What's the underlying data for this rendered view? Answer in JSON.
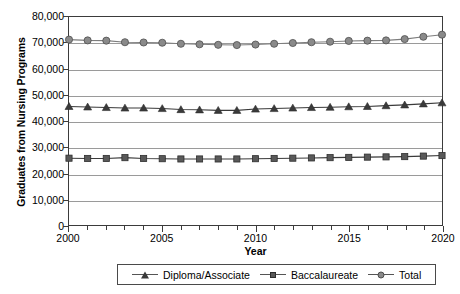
{
  "chart_data": {
    "type": "line",
    "title": "",
    "xlabel": "Year",
    "ylabel": "Graduates from Nursing Programs",
    "xlim": [
      2000,
      2020
    ],
    "ylim": [
      0,
      80000
    ],
    "grid": true,
    "legend_position": "bottom",
    "x": [
      2000,
      2001,
      2002,
      2003,
      2004,
      2005,
      2006,
      2007,
      2008,
      2009,
      2010,
      2011,
      2012,
      2013,
      2014,
      2015,
      2016,
      2017,
      2018,
      2019,
      2020
    ],
    "y_ticks": [
      0,
      10000,
      20000,
      30000,
      40000,
      50000,
      60000,
      70000,
      80000
    ],
    "y_tick_labels": [
      "0",
      "10,000",
      "20,000",
      "30,000",
      "40,000",
      "50,000",
      "60,000",
      "70,000",
      "80,000"
    ],
    "x_tick_labels": [
      {
        "value": 2000,
        "label": "2000"
      },
      {
        "value": 2005,
        "label": "2005"
      },
      {
        "value": 2010,
        "label": "2010"
      },
      {
        "value": 2015,
        "label": "2015"
      },
      {
        "value": 2020,
        "label": "2020"
      }
    ],
    "series": [
      {
        "name": "Diploma/Associate",
        "marker": "triangle",
        "color": "#3a3a3a",
        "values": [
          45600,
          45400,
          45200,
          45000,
          45000,
          44800,
          44400,
          44300,
          44100,
          44100,
          44600,
          44800,
          45000,
          45200,
          45300,
          45500,
          45600,
          45900,
          46200,
          46600,
          47000
        ]
      },
      {
        "name": "Baccalaureate",
        "marker": "square",
        "color": "#595959",
        "values": [
          25700,
          25600,
          25600,
          25900,
          25600,
          25500,
          25400,
          25400,
          25400,
          25400,
          25500,
          25600,
          25700,
          25800,
          25900,
          26000,
          26100,
          26200,
          26300,
          26500,
          26700
        ]
      },
      {
        "name": "Total",
        "marker": "circle",
        "color": "#8a8a8a",
        "values": [
          71300,
          71000,
          70900,
          70300,
          70200,
          70100,
          69700,
          69500,
          69300,
          69200,
          69400,
          69700,
          70000,
          70300,
          70500,
          70800,
          70900,
          71000,
          71500,
          72400,
          73200
        ]
      }
    ]
  },
  "legend": {
    "items": [
      {
        "label": "Diploma/Associate",
        "marker": "triangle"
      },
      {
        "label": "Baccalaureate",
        "marker": "square"
      },
      {
        "label": "Total",
        "marker": "circle"
      }
    ]
  }
}
